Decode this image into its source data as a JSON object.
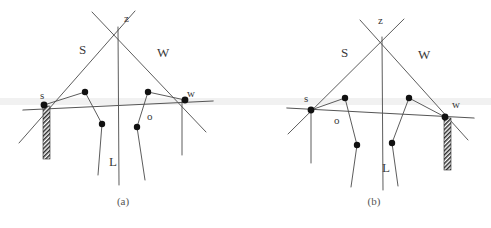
{
  "figure": {
    "background_color": "#ffffff",
    "line_color": "#4a4a4a",
    "node_color": "#111111",
    "band_color": "#f1f1f1",
    "hatch_color": "#2b2b2b"
  },
  "panels": [
    {
      "id": "a",
      "caption": "(a)",
      "caption_x": 123,
      "caption_y": 205,
      "labels": {
        "apex": "z",
        "left_arm": "S",
        "right_arm": "W",
        "left_node": "s",
        "right_node": "w",
        "inner_node": "o",
        "vertical_line": "L"
      },
      "label_positions": {
        "apex": [
          124,
          22
        ],
        "left_arm": [
          79,
          54
        ],
        "right_arm": [
          157,
          57
        ],
        "left_node": [
          40,
          99
        ],
        "right_node": [
          187,
          97
        ],
        "inner_node": [
          147,
          120
        ],
        "vertical_line": [
          109,
          166
        ]
      },
      "nodes": {
        "s": [
          44,
          105
        ],
        "w": [
          185,
          100
        ],
        "p1": [
          85,
          92
        ],
        "p2": [
          102,
          124
        ],
        "p3": [
          148,
          92
        ],
        "p4": [
          137,
          127
        ]
      },
      "apex_point": [
        113,
        28
      ],
      "hatch_bar": {
        "x": 43,
        "y": 106,
        "w": 7,
        "h": 53,
        "anchor": "s"
      }
    },
    {
      "id": "b",
      "caption": "(b)",
      "caption_x": 374,
      "caption_y": 205,
      "labels": {
        "apex": "z",
        "left_arm": "S",
        "right_arm": "W",
        "left_node": "s",
        "right_node": "w",
        "inner_node": "o",
        "vertical_line": "L"
      },
      "label_positions": {
        "apex": [
          378,
          24
        ],
        "left_arm": [
          341,
          57
        ],
        "right_arm": [
          418,
          59
        ],
        "left_node": [
          304,
          102
        ],
        "right_node": [
          452,
          98
        ],
        "inner_node": [
          334,
          124
        ],
        "vertical_line": [
          382,
          172
        ]
      },
      "nodes": {
        "s": [
          311,
          110
        ],
        "w": [
          445,
          117
        ],
        "p1": [
          345,
          98
        ],
        "p2": [
          357,
          145
        ],
        "p3": [
          409,
          98
        ],
        "p4": [
          392,
          143
        ]
      },
      "apex_point": [
        381,
        38
      ],
      "hatch_bar": {
        "x": 444,
        "y": 118,
        "w": 7,
        "h": 52,
        "anchor": "w"
      }
    }
  ],
  "bands": [
    {
      "x": 0,
      "y": 98,
      "w": 491,
      "h": 7
    }
  ]
}
